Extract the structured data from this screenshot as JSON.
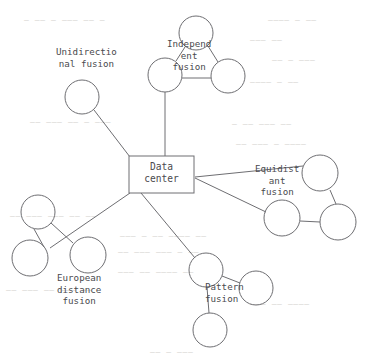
{
  "diagram": {
    "type": "node-link-topology",
    "hub": {
      "shape": "rectangle",
      "label_line1": "Data",
      "label_line2": "center",
      "x": 129,
      "y": 156,
      "width": 65,
      "height": 37
    },
    "stroke_color": "#6e6e72",
    "text_color": "#4a4a4e",
    "background_color": "#ffffff",
    "branches": [
      {
        "id": "unidirectional",
        "label_line1": "Unidirectio",
        "label_line2": "nal fusion",
        "label_line3": "",
        "label_x": 56,
        "label_y": 46,
        "align": "center",
        "node_count": 1
      },
      {
        "id": "independent",
        "label_line1": "Independ",
        "label_line2": "ent",
        "label_line3": "fusion",
        "label_x": 167,
        "label_y": 38,
        "align": "center",
        "node_count": 3
      },
      {
        "id": "equidistant",
        "label_line1": "Equidist",
        "label_line2": "ant",
        "label_line3": "fusion",
        "label_x": 255,
        "label_y": 163,
        "align": "center",
        "node_count": 3
      },
      {
        "id": "european-distance",
        "label_line1": "European",
        "label_line2": "distance",
        "label_line3": "fusion",
        "label_x": 57,
        "label_y": 272,
        "align": "center",
        "node_count": 3
      },
      {
        "id": "pattern",
        "label_line1": "Pattern",
        "label_line2": "fusion",
        "label_line3": "",
        "label_x": 205,
        "label_y": 281,
        "align": "left",
        "node_count": 3
      }
    ],
    "nodes": [
      {
        "id": "unidirectional-n1",
        "cx": 82,
        "cy": 97,
        "r": 17
      },
      {
        "id": "independent-top",
        "cx": 196,
        "cy": 33,
        "r": 17
      },
      {
        "id": "independent-left",
        "cx": 165,
        "cy": 75,
        "r": 17
      },
      {
        "id": "independent-right",
        "cx": 228,
        "cy": 76,
        "r": 17
      },
      {
        "id": "equidistant-left",
        "cx": 282,
        "cy": 218,
        "r": 18
      },
      {
        "id": "equidistant-top",
        "cx": 320,
        "cy": 173,
        "r": 18
      },
      {
        "id": "equidistant-right",
        "cx": 338,
        "cy": 222,
        "r": 18
      },
      {
        "id": "european-upper",
        "cx": 38,
        "cy": 212,
        "r": 17
      },
      {
        "id": "european-lower",
        "cx": 30,
        "cy": 258,
        "r": 18
      },
      {
        "id": "european-right",
        "cx": 88,
        "cy": 255,
        "r": 18
      },
      {
        "id": "pattern-hub",
        "cx": 206,
        "cy": 270,
        "r": 17
      },
      {
        "id": "pattern-right",
        "cx": 256,
        "cy": 288,
        "r": 17
      },
      {
        "id": "pattern-bottom",
        "cx": 210,
        "cy": 330,
        "r": 17
      }
    ],
    "edges": [
      {
        "id": "hub-to-unidirectional",
        "x1": 130,
        "y1": 157,
        "x2": 94,
        "y2": 110
      },
      {
        "id": "hub-to-independent",
        "x1": 165,
        "y1": 156,
        "x2": 165,
        "y2": 92
      },
      {
        "id": "hub-to-equidistant-top",
        "x1": 195,
        "y1": 177,
        "x2": 303,
        "y2": 166
      },
      {
        "id": "hub-to-equidistant-left",
        "x1": 195,
        "y1": 178,
        "x2": 266,
        "y2": 212
      },
      {
        "id": "hub-to-european",
        "x1": 130,
        "y1": 193,
        "x2": 50,
        "y2": 248
      },
      {
        "id": "hub-to-pattern",
        "x1": 141,
        "y1": 193,
        "x2": 195,
        "y2": 258
      },
      {
        "id": "independent-top-left",
        "x1": 185,
        "y1": 47,
        "x2": 176,
        "y2": 61
      },
      {
        "id": "independent-top-right",
        "x1": 208,
        "y1": 46,
        "x2": 218,
        "y2": 62
      },
      {
        "id": "independent-left-right",
        "x1": 182,
        "y1": 78,
        "x2": 211,
        "y2": 78
      },
      {
        "id": "equidistant-top-right",
        "x1": 330,
        "y1": 190,
        "x2": 336,
        "y2": 204
      },
      {
        "id": "equidistant-left-right",
        "x1": 300,
        "y1": 221,
        "x2": 320,
        "y2": 222
      },
      {
        "id": "european-upper-right",
        "x1": 51,
        "y1": 223,
        "x2": 73,
        "y2": 243
      },
      {
        "id": "european-upper-lower",
        "x1": 34,
        "y1": 229,
        "x2": 44,
        "y2": 247
      },
      {
        "id": "pattern-hub-right",
        "x1": 222,
        "y1": 276,
        "x2": 240,
        "y2": 283
      },
      {
        "id": "pattern-hub-bottom",
        "x1": 207,
        "y1": 287,
        "x2": 209,
        "y2": 313
      }
    ]
  },
  "background_artifacts": [
    {
      "text": "—  —— — ——— —— —",
      "x": 24,
      "y": 16
    },
    {
      "text": "———— — ——",
      "x": 268,
      "y": 16
    },
    {
      "text": "——— ——",
      "x": 250,
      "y": 36
    },
    {
      "text": "—— — ———",
      "x": 272,
      "y": 56
    },
    {
      "text": "———— — ——",
      "x": 250,
      "y": 78
    },
    {
      "text": "—— ——— —— — ———",
      "x": 30,
      "y": 118
    },
    {
      "text": "— —— ——— ——",
      "x": 232,
      "y": 120
    },
    {
      "text": "—— ——— — ————",
      "x": 236,
      "y": 140
    },
    {
      "text": "—— ——— ——— —— ——",
      "x": 10,
      "y": 212
    },
    {
      "text": "——— — —— ———— ——",
      "x": 120,
      "y": 232
    },
    {
      "text": "—— ——— ——— — ——",
      "x": 118,
      "y": 248
    },
    {
      "text": "——— —— ———— ——",
      "x": 118,
      "y": 268
    },
    {
      "text": "—— ——— —— ——— ——",
      "x": 6,
      "y": 286
    },
    {
      "text": "——— —— ————",
      "x": 250,
      "y": 300
    },
    {
      "text": "—— — ———",
      "x": 150,
      "y": 348
    }
  ]
}
